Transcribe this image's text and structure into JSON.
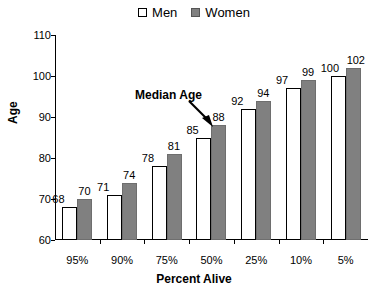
{
  "chart_data": {
    "type": "bar",
    "title": "",
    "xlabel": "Percent Alive",
    "ylabel": "Age",
    "categories": [
      "95%",
      "90%",
      "75%",
      "50%",
      "25%",
      "10%",
      "5%"
    ],
    "series": [
      {
        "name": "Men",
        "color": "#ffffff",
        "values": [
          68,
          71,
          78,
          85,
          92,
          97,
          100
        ]
      },
      {
        "name": "Women",
        "color": "#808080",
        "values": [
          70,
          74,
          81,
          88,
          94,
          99,
          102
        ]
      }
    ],
    "ylim": [
      60,
      110
    ],
    "yticks": [
      60,
      70,
      80,
      90,
      100,
      110
    ],
    "grid": false,
    "legend_position": "top-center",
    "annotations": [
      {
        "text": "Median Age",
        "points_to_category": "50%"
      }
    ]
  },
  "legend": {
    "men_label": "Men",
    "women_label": "Women"
  },
  "annotation": {
    "median_age_label": "Median Age"
  }
}
